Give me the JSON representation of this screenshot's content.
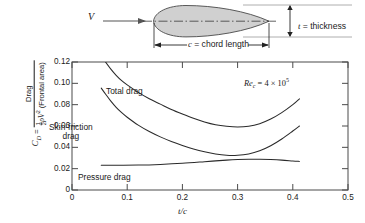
{
  "figure": {
    "diagram": {
      "flow_label": "V",
      "thickness_label_sym": "t",
      "thickness_label_text": " = thickness",
      "chord_label_sym": "c",
      "chord_label_text": " = chord length",
      "shape_fill": "#d0d0d0",
      "shape_stroke": "#3a3a3a"
    },
    "chart_title": ""
  },
  "chart_data": {
    "type": "line",
    "title": "",
    "subtitle": "",
    "xlabel": "t/c",
    "ylabel": "C_D = Drag / ( 1/2 rho V^2 (Frontal area) )",
    "ylabel_parts": {
      "symbol": "C",
      "symbol_sub": "D",
      "equals": "=",
      "numerator": "Frontal area)",
      "num_main": "Drag",
      "den_rho": "ρ",
      "den_v": "V",
      "den_v_sup": "2",
      "den_tail": "(Frontal area)",
      "half_num": "1",
      "half_den": "2"
    },
    "xlim": [
      0,
      0.5
    ],
    "ylim": [
      0,
      0.12
    ],
    "xticks": [
      0,
      0.1,
      0.2,
      0.3,
      0.4,
      0.5
    ],
    "xticklabels": [
      "0",
      "0.1",
      "0.2",
      "0.3",
      "0.4",
      "0.5"
    ],
    "yticks": [
      0,
      0.02,
      0.04,
      0.06,
      0.08,
      0.1,
      0.12
    ],
    "yticklabels": [
      "0",
      "0.02",
      "0.04",
      "0.06",
      "0.08",
      "0.10",
      "0.12"
    ],
    "grid": false,
    "legend_position": "inline-annotations",
    "annotations": [
      {
        "name": "reynolds-number",
        "text": "Re_c = 4 × 10^5",
        "re_symbol": "Re",
        "re_sub": "c",
        "re_equals": " = 4 × 10",
        "re_sup": "5",
        "x": 0.3,
        "y": 0.107
      }
    ],
    "series": [
      {
        "name": "Total drag",
        "label": "Total drag",
        "color": "#2a2a2a",
        "x": [
          0.058,
          0.07,
          0.08,
          0.09,
          0.1,
          0.12,
          0.14,
          0.16,
          0.18,
          0.2,
          0.22,
          0.24,
          0.26,
          0.28,
          0.3,
          0.32,
          0.34,
          0.36,
          0.38,
          0.4,
          0.412
        ],
        "y": [
          0.122,
          0.1135,
          0.1075,
          0.1025,
          0.0985,
          0.0915,
          0.0855,
          0.0805,
          0.0755,
          0.0712,
          0.0672,
          0.0638,
          0.0612,
          0.0597,
          0.059,
          0.0597,
          0.0622,
          0.0665,
          0.0725,
          0.08,
          0.0855
        ]
      },
      {
        "name": "Skin-friction drag",
        "label": "Skin-friction drag",
        "color": "#2a2a2a",
        "x": [
          0.053,
          0.06,
          0.07,
          0.08,
          0.09,
          0.1,
          0.12,
          0.14,
          0.16,
          0.18,
          0.2,
          0.22,
          0.24,
          0.26,
          0.28,
          0.3,
          0.32,
          0.34,
          0.36,
          0.38,
          0.4,
          0.412
        ],
        "y": [
          0.0955,
          0.0905,
          0.0835,
          0.0775,
          0.0725,
          0.0682,
          0.0608,
          0.0548,
          0.0498,
          0.0455,
          0.0418,
          0.0385,
          0.0358,
          0.0337,
          0.0325,
          0.0325,
          0.0338,
          0.0368,
          0.0415,
          0.0478,
          0.0553,
          0.06
        ]
      },
      {
        "name": "Pressure drag",
        "label": "Pressure drag",
        "color": "#2a2a2a",
        "x": [
          0.053,
          0.08,
          0.12,
          0.16,
          0.2,
          0.24,
          0.26,
          0.28,
          0.3,
          0.32,
          0.34,
          0.36,
          0.38,
          0.4,
          0.412
        ],
        "y": [
          0.0232,
          0.0232,
          0.0234,
          0.024,
          0.025,
          0.0265,
          0.0273,
          0.028,
          0.0285,
          0.0288,
          0.0288,
          0.0285,
          0.028,
          0.0272,
          0.0268
        ]
      }
    ]
  }
}
